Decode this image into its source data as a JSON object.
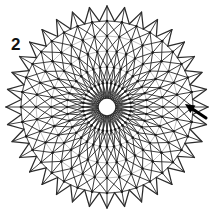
{
  "figure": {
    "step_label": "2",
    "caption": "",
    "width": 214,
    "height": 214,
    "background_color": "#ffffff"
  },
  "diagram": {
    "name": "radial-star-mesh",
    "center_x": 107,
    "center_y": 107,
    "spoke_count": 36,
    "ring_count": 6,
    "hub_radius": 9,
    "outer_point_radius": 101,
    "inner_valley_radius": 86,
    "ring_radii": [
      9,
      24,
      40,
      56,
      71,
      86
    ],
    "line_color": "#2b2b2b",
    "light_line_color": "#b4b4b4",
    "node_color": "#1a1a1a",
    "node_radius": 1.3,
    "line_width": 1.0,
    "outer_line_width": 1.25,
    "hub_line_width": 1.4
  },
  "annotations": {
    "arrow": {
      "name": "pointer-arrow",
      "color": "#000000",
      "tail_x": 206,
      "tail_y": 118,
      "tip_x": 185,
      "tip_y": 104,
      "target": "horizontal-spoke-right"
    }
  }
}
